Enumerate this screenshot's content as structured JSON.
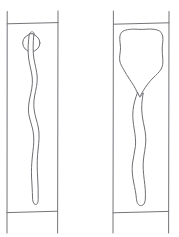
{
  "figure": {
    "background_color": "#ffffff",
    "line_color": "#74747a",
    "width": 179,
    "height": 237,
    "panel_count": 2
  },
  "panels": [
    {
      "id": "left-panel",
      "label": "Left specimen panel",
      "frame": {
        "left_x": 7,
        "right_x": 58,
        "top_rule_y": 23,
        "bottom_rule_y": 212,
        "vertical_extent_top_y": 11,
        "vertical_extent_bottom_y": 233
      },
      "features": [
        {
          "name": "circular-body",
          "label": "Small circular body",
          "center_x": 31,
          "center_y": 42,
          "radius": 9,
          "shape": "circle"
        },
        {
          "name": "apical-cap",
          "label": "Small cap above circle",
          "shape": "small-loop"
        },
        {
          "name": "wavy-filament",
          "label": "Long wavy filament tail",
          "top_y": 33,
          "tip_y": 204,
          "width_px": 7,
          "shape": "meandering-outline"
        }
      ]
    },
    {
      "id": "right-panel",
      "label": "Right specimen panel",
      "frame": {
        "left_x": 113,
        "right_x": 169,
        "top_rule_y": 23,
        "bottom_rule_y": 212,
        "vertical_extent_top_y": 11,
        "vertical_extent_bottom_y": 233
      },
      "features": [
        {
          "name": "funnel-body",
          "label": "Large lobed funnel-shaped body",
          "top_y": 29,
          "bottom_y": 96,
          "left_x": 119,
          "right_x": 163,
          "shape": "lobed-funnel"
        },
        {
          "name": "wavy-tail",
          "label": "Long wavy tail below funnel neck",
          "top_y": 96,
          "tip_y": 205,
          "width_px": 9,
          "shape": "meandering-outline"
        }
      ]
    }
  ]
}
